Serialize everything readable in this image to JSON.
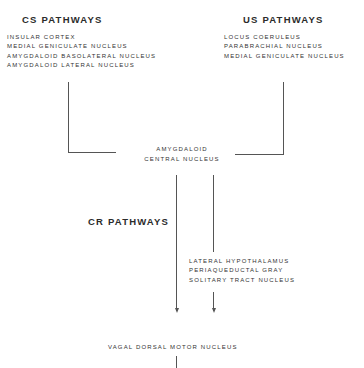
{
  "diagram": {
    "cs_pathways": {
      "title": "CS PATHWAYS",
      "items": [
        "INSULAR CORTEX",
        "MEDIAL GENICULATE NUCLEUS",
        "AMYGDALOID BASOLATERAL NUCLEUS",
        "AMYGDALOID LATERAL NUCLEUS"
      ]
    },
    "us_pathways": {
      "title": "US PATHWAYS",
      "items": [
        "LOCUS COERULEUS",
        "PARABRACHIAL NUCLEUS",
        "MEDIAL GENICULATE NUCLEUS"
      ]
    },
    "central_node": {
      "line1": "AMYGDALOID",
      "line2": "CENTRAL NUCLEUS"
    },
    "cr_pathways": {
      "title": "CR PATHWAYS",
      "items": [
        "LATERAL HYPOTHALAMUS",
        "PERIAQUEDUCTAL GRAY",
        "SOLITARY TRACT NUCLEUS"
      ]
    },
    "output_node": {
      "label": "VAGAL DORSAL MOTOR NUCLEUS"
    },
    "colors": {
      "line": "#555555",
      "text": "#2a2a2a",
      "background": "#ffffff"
    }
  }
}
